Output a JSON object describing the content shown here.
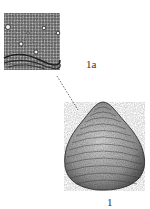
{
  "figure": {
    "label_detail": "1a",
    "label_shell": "1",
    "colors": {
      "ink": "#2a2a2a",
      "paper": "#ffffff",
      "mid": "#8a8a8a"
    }
  }
}
